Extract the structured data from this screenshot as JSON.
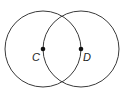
{
  "diagram": {
    "stroke_color": "#3a3a3a",
    "point_color": "#111111",
    "radius": 38,
    "circles": [
      {
        "name": "circle-c",
        "center": "C",
        "cx": 43,
        "cy": 49
      },
      {
        "name": "circle-d",
        "center": "D",
        "cx": 81,
        "cy": 49
      }
    ],
    "points": [
      {
        "label": "C",
        "x": 43,
        "y": 49
      },
      {
        "label": "D",
        "x": 81,
        "y": 49
      }
    ]
  }
}
